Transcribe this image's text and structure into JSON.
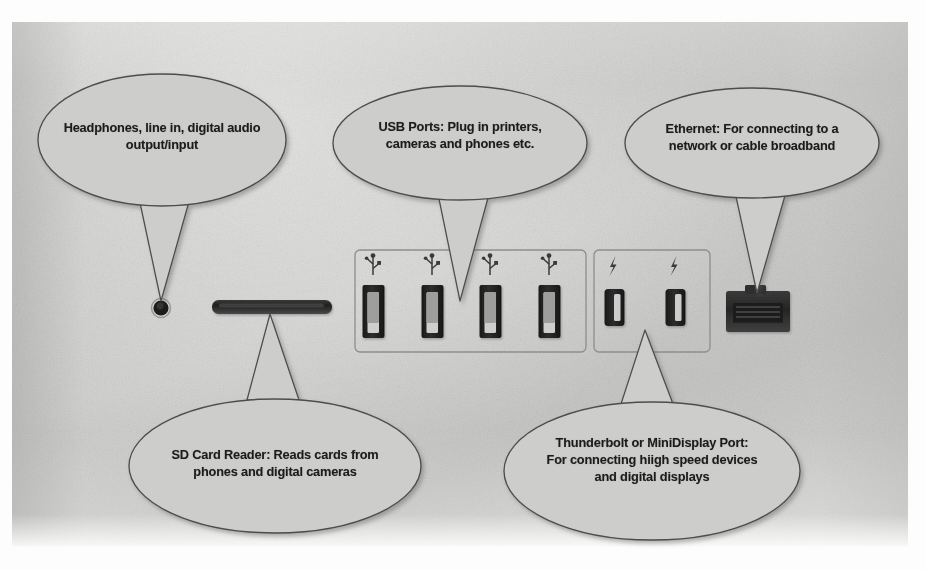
{
  "image": {
    "kind": "photograph-of-printed-diagram",
    "subject": "Computer rear port panel with labelled callouts",
    "background_color": "#c8c8c6",
    "page_border_color": "#fdfdfd",
    "balloon_fill": "#cdcdcb",
    "balloon_stroke": "#4a4a48",
    "text_color": "#1c1c1c",
    "port_dark_color": "#2b2b2b"
  },
  "callouts": [
    {
      "id": "headphones",
      "name": "headphones-callout",
      "lines": [
        "Headphones, line in, digital audio",
        "output/input"
      ],
      "points_to": "headphone-jack"
    },
    {
      "id": "usb",
      "name": "usb-callout",
      "lines": [
        "USB Ports: Plug in printers,",
        "cameras and phones etc."
      ],
      "points_to": "usb-port-group"
    },
    {
      "id": "ethernet",
      "name": "ethernet-callout",
      "lines": [
        "Ethernet: For connecting to a",
        "network or cable broadband"
      ],
      "points_to": "ethernet-port"
    },
    {
      "id": "sdcard",
      "name": "sd-card-callout",
      "lines": [
        "SD Card Reader: Reads cards from",
        "phones and digital cameras"
      ],
      "points_to": "sd-card-slot"
    },
    {
      "id": "thunderbolt",
      "name": "thunderbolt-callout",
      "lines": [
        "Thunderbolt or MiniDisplay Port:",
        "For connecting hiigh speed devices",
        "and digital displays"
      ],
      "points_to": "thunderbolt-port-group"
    }
  ],
  "ports": {
    "headphone_jack": {
      "label": "headphone-jack",
      "shape": "circle",
      "count": 1
    },
    "sd_card_slot": {
      "label": "sd-card-slot",
      "shape": "horizontal-slot",
      "count": 1
    },
    "usb_group": {
      "label": "usb-port-group",
      "count": 4,
      "icon": "usb-trident-icon"
    },
    "thunderbolt_group": {
      "label": "thunderbolt-port-group",
      "count": 2,
      "icon": "lightning-bolt-icon"
    },
    "ethernet_port": {
      "label": "ethernet-port",
      "shape": "rj45",
      "count": 1
    }
  }
}
